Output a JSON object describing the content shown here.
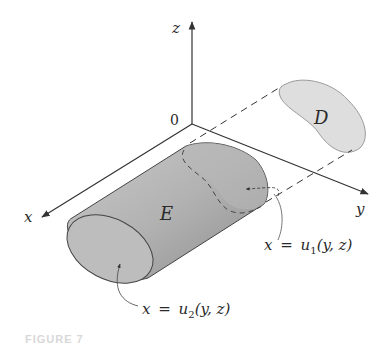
{
  "figure": {
    "caption": "FIGURE 7",
    "axes": {
      "x_label": "x",
      "y_label": "y",
      "z_label": "z",
      "origin_label": "0"
    },
    "regions": {
      "solid_label": "E",
      "projection_label": "D"
    },
    "annotations": {
      "back_surface": {
        "var": "x",
        "eq": "=",
        "fn": "u",
        "sub": "1",
        "args": "(y, z)"
      },
      "front_surface": {
        "var": "x",
        "eq": "=",
        "fn": "u",
        "sub": "2",
        "args": "(y, z)"
      }
    },
    "colors": {
      "line": "#333333",
      "solid_fill": "#a9a9a9",
      "face_fill": "#bdbdbd",
      "projection_fill": "#dedede"
    }
  }
}
